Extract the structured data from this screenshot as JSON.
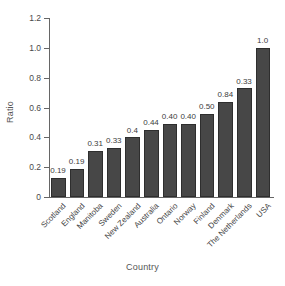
{
  "chart_data": {
    "type": "bar",
    "title": "",
    "xlabel": "Country",
    "ylabel": "Ratio",
    "categories": [
      "Scotland",
      "England",
      "Manitoba",
      "Sweden",
      "New Zealand",
      "Australia",
      "Ontario",
      "Norway",
      "Finland",
      "Denmark",
      "The Netherlands",
      "USA"
    ],
    "values": [
      0.13,
      0.19,
      0.31,
      0.33,
      0.4,
      0.45,
      0.49,
      0.49,
      0.56,
      0.64,
      0.73,
      1.0
    ],
    "data_labels": [
      "0.19",
      "0.19",
      "0.31",
      "0.33",
      "0.4",
      "0.44",
      "0.40",
      "0.40",
      "0.50",
      "0.84",
      "0.33",
      "1.0"
    ],
    "ylim": [
      0,
      1.2
    ],
    "yticks": [
      0,
      0.2,
      0.4,
      0.6,
      0.8,
      1.0,
      1.2
    ],
    "ytick_labels": [
      "0",
      "0.2",
      "0.4",
      "0.6",
      "0.8",
      "1.0",
      "1.2"
    ],
    "grid": false,
    "legend": false,
    "bar_color": "#474747",
    "axis_color": "#666666",
    "background": "#ffffff"
  }
}
